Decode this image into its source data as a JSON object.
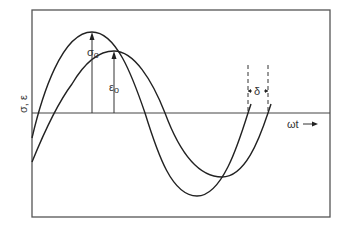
{
  "diagram": {
    "y_axis_label": "σ, ε",
    "x_axis_label": "ωt",
    "x_axis_arrow": "→",
    "curves": [
      {
        "name": "stress",
        "symbol": "σ",
        "amplitude_label": "σ",
        "amplitude_sub": "o",
        "leads": true
      },
      {
        "name": "strain",
        "symbol": "ε",
        "amplitude_label": "ε",
        "amplitude_sub": "o",
        "leads": false
      }
    ],
    "phase_lag_label": "δ",
    "colors": {
      "line": "#222222",
      "frame": "#555555",
      "background": "#ffffff"
    }
  }
}
